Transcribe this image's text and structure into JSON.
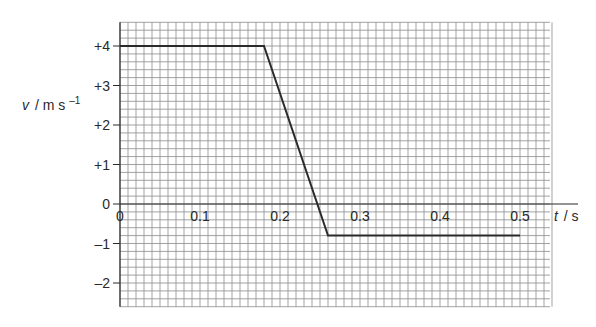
{
  "chart_data": {
    "type": "line",
    "title": "",
    "xlabel": "t / s",
    "ylabel": "v / m s⁻¹",
    "xlabel_parts": {
      "symbol": "t",
      "unit": "/ s"
    },
    "ylabel_parts": {
      "symbol": "v",
      "unit": "/ m s",
      "sup": "–1"
    },
    "x_ticks": [
      "0",
      "0.1",
      "0.2",
      "0.3",
      "0.4",
      "0.5"
    ],
    "x_tick_values": [
      0,
      0.1,
      0.2,
      0.3,
      0.4,
      0.5
    ],
    "y_ticks": [
      "+4",
      "+3",
      "+2",
      "+1",
      "0",
      "–1",
      "–2"
    ],
    "y_tick_values": [
      4,
      3,
      2,
      1,
      0,
      -1,
      -2
    ],
    "xlim": [
      0,
      0.5375
    ],
    "ylim": [
      -2.6,
      4.6
    ],
    "grid": true,
    "grid_minor_step_x": 0.01,
    "grid_minor_step_y": 0.2,
    "legend": null,
    "series": [
      {
        "name": "velocity",
        "x": [
          0,
          0.18,
          0.26,
          0.5
        ],
        "y": [
          4,
          4,
          -0.8,
          -0.8
        ]
      }
    ]
  },
  "colors": {
    "grid": "#8a8a8a",
    "line": "#2b2b2b",
    "text": "#2a2a2a"
  }
}
